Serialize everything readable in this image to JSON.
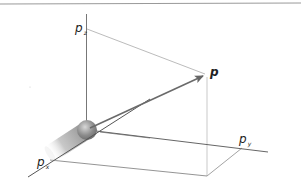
{
  "diagram": {
    "type": "3d-momentum-space",
    "axes": [
      {
        "id": "pz",
        "symbol": "p",
        "subscript": "z"
      },
      {
        "id": "py",
        "symbol": "p",
        "subscript": "y"
      },
      {
        "id": "px",
        "symbol": "p",
        "subscript": "x"
      }
    ],
    "vector": {
      "label": "p"
    },
    "colors": {
      "axis": "#555555",
      "projection": "#aaaaaa",
      "vector": "#6a6a6a",
      "top_rule": "#999999",
      "sphere": "#8a8a8a"
    }
  }
}
